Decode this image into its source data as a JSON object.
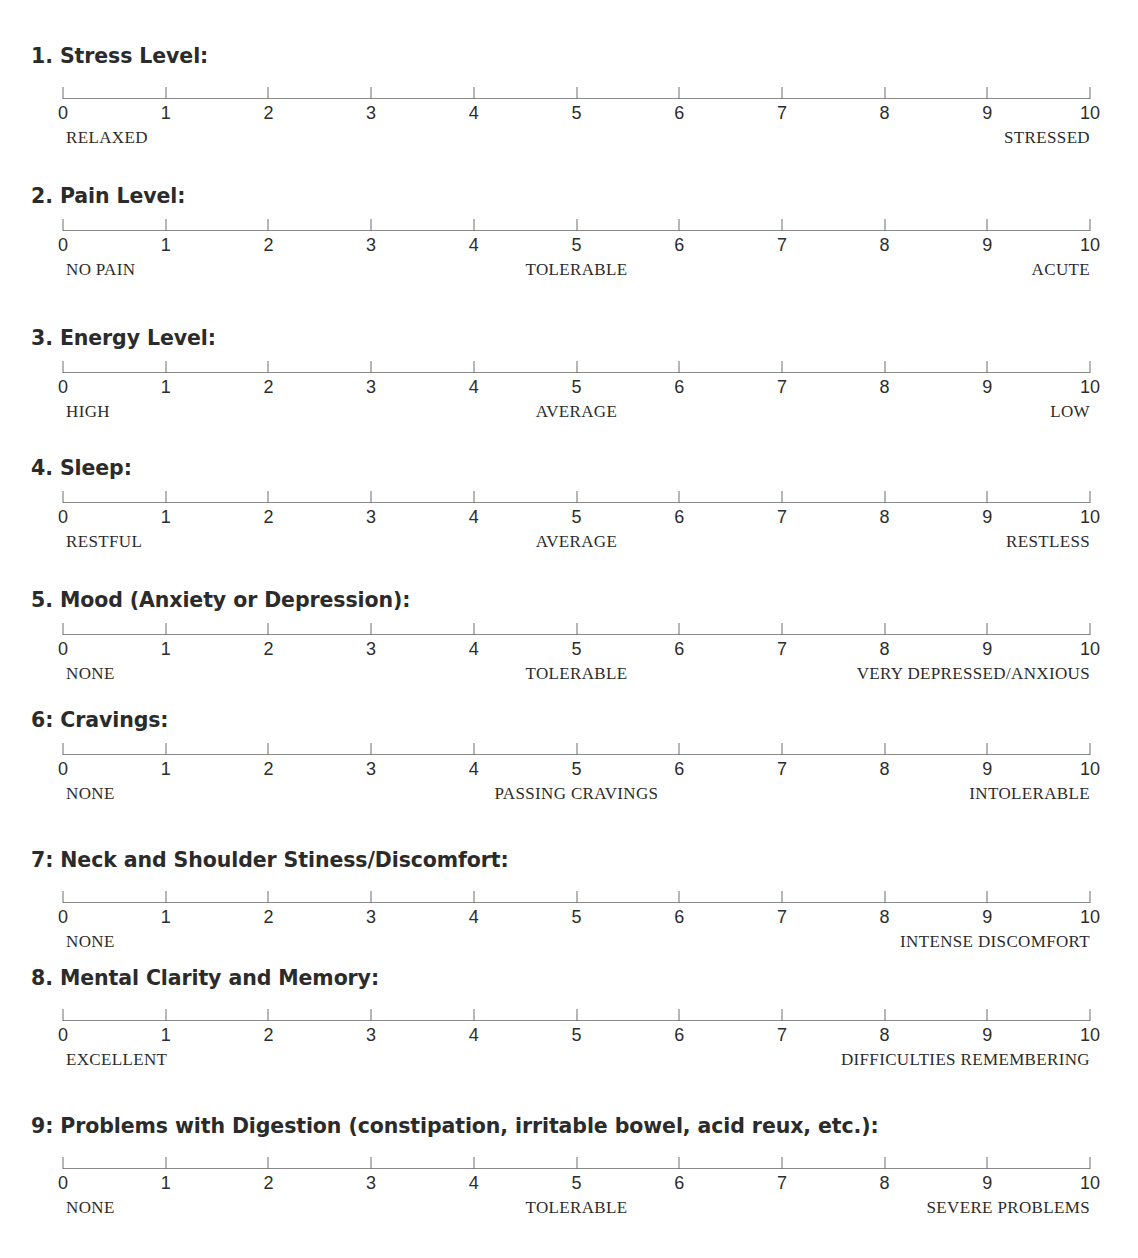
{
  "document": {
    "type": "symptom-rating-scale-form",
    "scale": {
      "min": 0,
      "max": 10,
      "tick_labels": [
        "0",
        "1",
        "2",
        "3",
        "4",
        "5",
        "6",
        "7",
        "8",
        "9",
        "10"
      ]
    },
    "colors": {
      "text": "#231f20",
      "heading": "#2b2b2b",
      "axis": "#8a8a8a",
      "tick": "#6f6f6f",
      "background": "#ffffff"
    }
  },
  "questions": [
    {
      "number": "1.",
      "title": "1. Stress Level:",
      "anchors": {
        "left": "RELAXED",
        "center": "",
        "right": "STRESSED"
      }
    },
    {
      "number": "2.",
      "title": "2. Pain Level:",
      "anchors": {
        "left": "NO PAIN",
        "center": "TOLERABLE",
        "right": "ACUTE"
      }
    },
    {
      "number": "3.",
      "title": "3. Energy Level:",
      "anchors": {
        "left": "HIGH",
        "center": "AVERAGE",
        "right": "LOW"
      }
    },
    {
      "number": "4.",
      "title": "4. Sleep:",
      "anchors": {
        "left": "RESTFUL",
        "center": "AVERAGE",
        "right": "RESTLESS"
      }
    },
    {
      "number": "5.",
      "title": "5. Mood (Anxiety or Depression):",
      "anchors": {
        "left": "NONE",
        "center": "TOLERABLE",
        "right": "VERY DEPRESSED/ANXIOUS"
      }
    },
    {
      "number": "6:",
      "title": "6: Cravings:",
      "anchors": {
        "left": "NONE",
        "center": "PASSING CRAVINGS",
        "right": "INTOLERABLE"
      }
    },
    {
      "number": "7:",
      "title": "7: Neck and Shoulder Stiness/Discomfort:",
      "anchors": {
        "left": "NONE",
        "center": "",
        "right": "INTENSE DISCOMFORT"
      }
    },
    {
      "number": "8.",
      "title": "8. Mental Clarity and Memory:",
      "anchors": {
        "left": "EXCELLENT",
        "center": "",
        "right": "DIFFICULTIES REMEMBERING"
      }
    },
    {
      "number": "9:",
      "title": "9: Problems with Digestion (constipation, irritable bowel, acid reux, etc.):",
      "anchors": {
        "left": "NONE",
        "center": "TOLERABLE",
        "right": "SEVERE PROBLEMS"
      }
    }
  ],
  "layout": {
    "question_tops": [
      44,
      184,
      326,
      456,
      588,
      708,
      848,
      966,
      1114
    ],
    "scale_tops": [
      82,
      214,
      356,
      486,
      618,
      738,
      886,
      1004,
      1152
    ]
  }
}
